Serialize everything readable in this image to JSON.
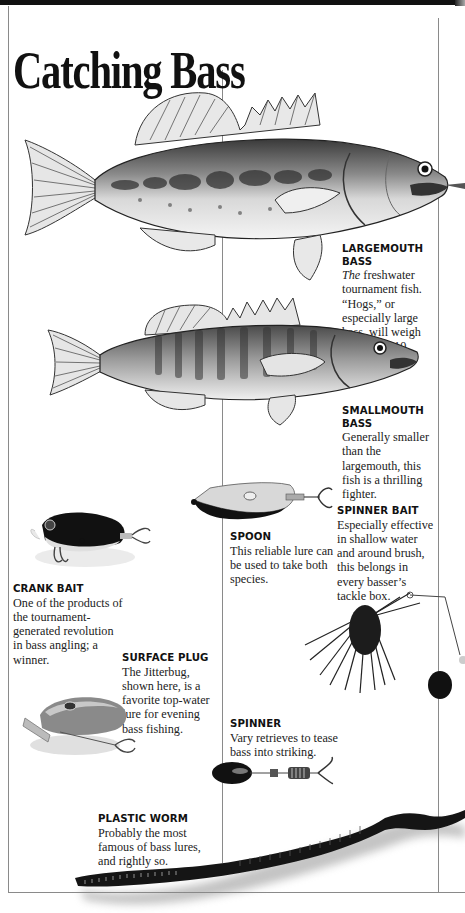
{
  "page": {
    "title": "Catching Bass"
  },
  "fish": [
    {
      "id": "largemouth",
      "heading_line1": "LARGEMOUTH",
      "heading_line2": "BASS",
      "body_em": "The",
      "body": " freshwater tournament fish. “Hogs,” or especially large bass, will weigh more than 10 pounds.",
      "image": "largemouth-bass-illustration"
    },
    {
      "id": "smallmouth",
      "heading_line1": "SMALLMOUTH",
      "heading_line2": "BASS",
      "body": "Generally smaller than the largemouth, this fish is a thrilling fighter.",
      "image": "smallmouth-bass-illustration"
    }
  ],
  "lures": [
    {
      "id": "spoon",
      "heading": "SPOON",
      "body": "This reliable lure can be used to take both species.",
      "image": "spoon-lure-photo"
    },
    {
      "id": "spinner_bait",
      "heading": "SPINNER BAIT",
      "body": "Especially effective in shallow water and around brush, this belongs in every basser’s tackle box.",
      "image": "spinner-bait-photo"
    },
    {
      "id": "crank_bait",
      "heading": "CRANK BAIT",
      "body": "One of the products of the tournament-generated revolution in bass angling; a winner.",
      "image": "crank-bait-photo"
    },
    {
      "id": "surface_plug",
      "heading": "SURFACE PLUG",
      "body": "The Jitterbug, shown here, is a favorite top-water lure for evening bass fishing.",
      "image": "jitterbug-surface-plug-photo"
    },
    {
      "id": "spinner",
      "heading": "SPINNER",
      "body": "Vary retrieves to tease bass into striking.",
      "image": "spinner-lure-photo"
    },
    {
      "id": "plastic_worm",
      "heading": "PLASTIC WORM",
      "body": "Probably the most famous of bass lures, and rightly so.",
      "image": "plastic-worm-photo"
    }
  ],
  "colors": {
    "rule": "#8a8a8a",
    "topbar": "#111111",
    "text": "#222222"
  }
}
